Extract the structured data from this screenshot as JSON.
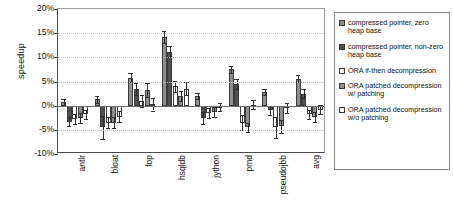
{
  "chart_data": {
    "type": "bar",
    "title": "",
    "xlabel": "",
    "ylabel": "speedup",
    "ylim": [
      -10,
      20
    ],
    "ytick_labels": [
      "20%",
      "15%",
      "10%",
      "5%",
      "0%",
      "-5%",
      "-10%"
    ],
    "ytick_values": [
      20,
      15,
      10,
      5,
      0,
      -5,
      -10
    ],
    "grid": true,
    "legend_position": "right-outside",
    "categories": [
      "antlr",
      "bloat",
      "fop",
      "hsqldb",
      "jython",
      "pmd",
      "pseudojbb",
      "avg"
    ],
    "series": [
      {
        "name": "compressed pointer, zero heap base",
        "swatch": "#8e8e8e",
        "values": [
          0.8,
          1.3,
          5.8,
          14.2,
          2.0,
          7.5,
          2.8,
          5.6
        ],
        "err_low": [
          0.6,
          0.7,
          1.0,
          1.3,
          0.6,
          0.8,
          0.6,
          0.7
        ],
        "err_high": [
          0.6,
          0.7,
          1.0,
          1.3,
          0.6,
          0.8,
          0.6,
          0.7
        ]
      },
      {
        "name": "compressed pointer, non-zero heap base",
        "swatch": "#4f4f4f",
        "values": [
          -3.3,
          -4.5,
          3.5,
          11.2,
          -2.5,
          4.5,
          -1.0,
          2.5
        ],
        "err_low": [
          1.0,
          2.3,
          1.2,
          1.2,
          1.2,
          1.0,
          1.0,
          0.9
        ],
        "err_high": [
          1.0,
          2.3,
          1.2,
          1.2,
          1.2,
          1.0,
          1.0,
          0.9
        ]
      },
      {
        "name": "ORA if-then decompression",
        "swatch": "#ffffff",
        "values": [
          -2.8,
          -3.5,
          1.0,
          4.0,
          -1.5,
          -3.5,
          -4.5,
          -1.8
        ],
        "err_low": [
          1.0,
          1.1,
          1.3,
          1.2,
          1.0,
          1.6,
          2.2,
          1.0
        ],
        "err_high": [
          1.0,
          1.1,
          1.3,
          1.2,
          1.0,
          1.6,
          2.2,
          1.0
        ]
      },
      {
        "name": "ORA patched decompression w/ patching",
        "swatch": "#8e8e8e",
        "values": [
          -2.5,
          -3.5,
          3.2,
          2.0,
          -1.3,
          -4.5,
          -4.3,
          -2.3
        ],
        "err_low": [
          1.0,
          1.1,
          1.4,
          1.1,
          1.0,
          0.9,
          1.3,
          1.0
        ],
        "err_high": [
          1.0,
          1.1,
          1.4,
          1.1,
          1.0,
          0.9,
          1.3,
          1.0
        ]
      },
      {
        "name": "ORA patched decompression w/o patching",
        "swatch": "#ffffff",
        "values": [
          -1.8,
          -2.3,
          0.3,
          3.5,
          -0.3,
          0.2,
          -0.5,
          -0.8
        ],
        "err_low": [
          0.9,
          1.1,
          1.3,
          1.3,
          0.9,
          0.9,
          1.0,
          1.0
        ],
        "err_high": [
          0.9,
          1.1,
          1.3,
          1.3,
          0.9,
          0.9,
          1.0,
          1.0
        ]
      }
    ]
  },
  "legend": {
    "entries": [
      "compressed pointer, zero heap base",
      "compressed pointer, non-zero heap base",
      "ORA if-then decompression",
      "ORA patched decompression w/ patching",
      "ORA patched decompression w/o patching"
    ]
  }
}
